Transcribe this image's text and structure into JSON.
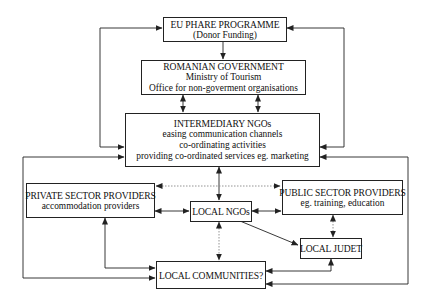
{
  "diagram": {
    "colors": {
      "line": "#222222",
      "dotted": "#888888",
      "background": "#ffffff"
    },
    "nodes": {
      "eu_phare": {
        "title": "EU PHARE PROGRAMME",
        "lines": [
          "(Donor Funding)"
        ]
      },
      "romanian_government": {
        "title": "ROMANIAN GOVERNMENT",
        "lines": [
          "Ministry of Tourism",
          "Office for non-goverment organisations"
        ]
      },
      "intermediary_ngos": {
        "title": "INTERMEDIARY NGOs",
        "lines": [
          "easing communication channels",
          "co-ordinating activities",
          "providing co-ordinated services eg. marketing"
        ]
      },
      "private_sector": {
        "title": "PRIVATE SECTOR PROVIDERS",
        "lines": [
          "accommodation providers"
        ]
      },
      "local_ngos": {
        "title": "LOCAL NGOs"
      },
      "public_sector": {
        "title": "PUBLIC SECTOR PROVIDERS",
        "lines": [
          "eg. training, education"
        ]
      },
      "local_judet": {
        "title": "LOCAL JUDET"
      },
      "local_communities": {
        "title": "LOCAL COMMUNITIES?"
      }
    },
    "edges": [
      {
        "from": "eu_phare",
        "to": "romanian_government",
        "style": "solid",
        "direction": "one-way"
      },
      {
        "from": "romanian_government",
        "to": "intermediary_ngos",
        "style": "solid",
        "direction": "two-way",
        "count": 2
      },
      {
        "from": "intermediary_ngos",
        "to": "eu_phare",
        "style": "solid",
        "direction": "one-way",
        "side": "left"
      },
      {
        "from": "intermediary_ngos",
        "to": "eu_phare",
        "style": "solid",
        "direction": "one-way",
        "side": "right"
      },
      {
        "from": "intermediary_ngos",
        "to": "local_ngos",
        "style": "solid",
        "direction": "two-way"
      },
      {
        "from": "private_sector",
        "to": "public_sector",
        "style": "dotted",
        "direction": "two-way"
      },
      {
        "from": "private_sector",
        "to": "local_ngos",
        "style": "solid",
        "direction": "two-way"
      },
      {
        "from": "local_ngos",
        "to": "public_sector",
        "style": "solid",
        "direction": "two-way"
      },
      {
        "from": "local_ngos",
        "to": "local_judet",
        "style": "solid",
        "direction": "one-way"
      },
      {
        "from": "public_sector",
        "to": "local_judet",
        "style": "dotted",
        "direction": "two-way"
      },
      {
        "from": "local_ngos",
        "to": "local_communities",
        "style": "dotted",
        "direction": "two-way"
      },
      {
        "from": "private_sector",
        "to": "local_communities",
        "style": "solid",
        "direction": "two-way"
      },
      {
        "from": "local_judet",
        "to": "local_communities",
        "style": "solid",
        "direction": "two-way"
      },
      {
        "from": "intermediary_ngos",
        "to": "local_communities",
        "style": "solid",
        "direction": "two-way",
        "side": "outer-left"
      },
      {
        "from": "intermediary_ngos",
        "to": "local_communities",
        "style": "solid",
        "direction": "two-way",
        "side": "outer-right"
      }
    ]
  }
}
